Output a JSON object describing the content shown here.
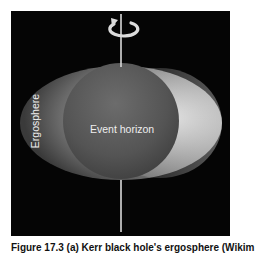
{
  "figure": {
    "labels": {
      "event_horizon": "Event horizon",
      "ergosphere": "Ergosphere"
    },
    "icons": {
      "rotation": "rotation-arrow-icon"
    },
    "colors": {
      "background": "#050505",
      "axis": "#d8d8d8",
      "label_text": "#eeeeee"
    }
  },
  "caption": {
    "text": "Figure 17.3 (a) Kerr black hole's ergosphere (Wikim"
  }
}
